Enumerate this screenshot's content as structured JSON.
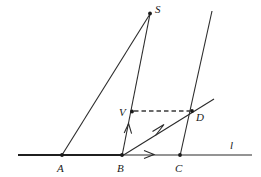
{
  "figure": {
    "background_color": "#ffffff",
    "stroke_color": "#2b2b2b",
    "dashed_color": "#3a3a3a",
    "width": 261,
    "height": 177
  },
  "labels": {
    "S": "S",
    "V": "V",
    "D": "D",
    "A": "A",
    "B": "B",
    "C": "C",
    "l": "l"
  },
  "points": [
    {
      "name": "S",
      "label": "S",
      "x": 150,
      "y": 13,
      "label_x": 156,
      "label_y": 11,
      "dot": true
    },
    {
      "name": "V",
      "label": "V",
      "x": 132,
      "y": 112,
      "label_x": 121,
      "label_y": 116,
      "dot": true
    },
    {
      "name": "D",
      "label": "D",
      "x": 192,
      "y": 111,
      "label_x": 197,
      "label_y": 119,
      "dot": true
    },
    {
      "name": "A",
      "label": "A",
      "x": 62,
      "y": 155,
      "label_x": 58,
      "label_y": 170,
      "dot": true
    },
    {
      "name": "B",
      "label": "B",
      "x": 122,
      "y": 155,
      "label_x": 118,
      "label_y": 170,
      "dot": true
    },
    {
      "name": "C",
      "label": "C",
      "x": 180,
      "y": 155,
      "label_x": 176,
      "label_y": 170,
      "dot": true
    }
  ],
  "segments": [
    {
      "name": "line-l",
      "from": [
        18,
        155
      ],
      "to": [
        252,
        155
      ],
      "style": "solid"
    },
    {
      "name": "segment-AB-thick",
      "from": [
        40,
        155
      ],
      "to": [
        122,
        155
      ],
      "style": "thick"
    },
    {
      "name": "segment-A-to-S",
      "from": [
        62,
        155
      ],
      "to": [
        150,
        14
      ],
      "style": "solid"
    },
    {
      "name": "segment-B-to-S",
      "from": [
        122,
        156
      ],
      "to": [
        150,
        14
      ],
      "style": "solid"
    },
    {
      "name": "segment-C-upward",
      "from": [
        180,
        156
      ],
      "to": [
        212,
        11
      ],
      "style": "solid"
    },
    {
      "name": "ray-B-through-D",
      "from": [
        122,
        156
      ],
      "to": [
        214,
        99
      ],
      "style": "solid"
    },
    {
      "name": "dashed-V-to-D",
      "from": [
        134,
        111
      ],
      "to": [
        191,
        111
      ],
      "style": "dashed"
    }
  ],
  "arrows": [
    {
      "name": "arrow-on-line-l",
      "x": 150,
      "y": 152,
      "direction": "right"
    },
    {
      "name": "arrow-on-BS",
      "x": 128,
      "y": 127,
      "direction": "up"
    },
    {
      "name": "arrow-on-BD",
      "x": 160,
      "y": 128,
      "direction": "upright"
    }
  ],
  "line_label": {
    "name": "l",
    "text": "l",
    "x": 233,
    "y": 147
  }
}
